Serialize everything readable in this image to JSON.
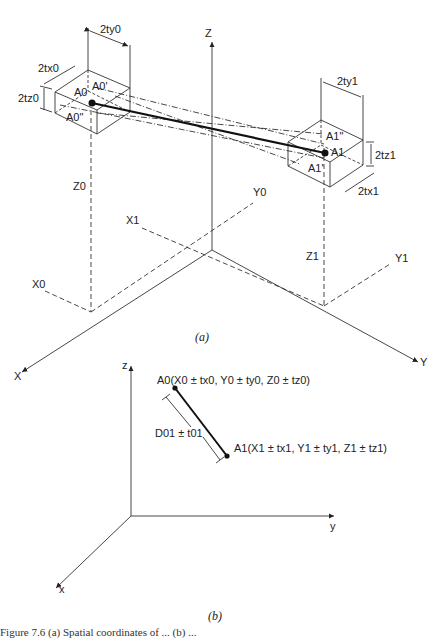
{
  "figure": {
    "part_a": {
      "caption": "(a)",
      "axes": {
        "x": "X",
        "y": "Y",
        "z": "Z"
      },
      "axis_marks": {
        "x0": "X0",
        "x1": "X1",
        "y0": "Y0",
        "y1": "Y1",
        "z0": "Z0",
        "z1": "Z1"
      },
      "box0": {
        "point": "A0",
        "upper": "A0'",
        "lower": "A0\"",
        "dim_x": "2tx0",
        "dim_y": "2ty0",
        "dim_z": "2tz0"
      },
      "box1": {
        "point": "A1",
        "upper": "A1\"",
        "lower": "A1'",
        "dim_x": "2tx1",
        "dim_y": "2ty1",
        "dim_z": "2tz1"
      }
    },
    "part_b": {
      "caption": "(b)",
      "axes": {
        "x": "x",
        "y": "y",
        "z": "z"
      },
      "point0_label": "A0(X0 ± tx0, Y0 ± ty0, Z0 ± tz0)",
      "point1_label": "A1(X1 ± tx1, Y1 ± ty1, Z1 ± tz1)",
      "distance_label": "D01 ± t01"
    },
    "caption_text": "Figure 7.6 (a) Spatial coordinates of ... (b) ..."
  }
}
